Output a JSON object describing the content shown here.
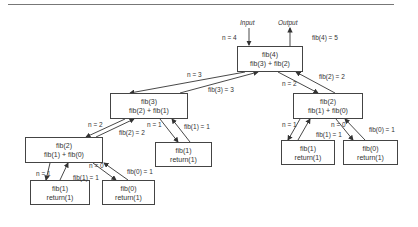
{
  "diagram": {
    "io": {
      "input": "Input",
      "output": "Output"
    },
    "nodes": [
      {
        "id": "fib4",
        "line1": "fib(4)",
        "line2": "fib(3) + fib(2)"
      },
      {
        "id": "fib3",
        "line1": "fib(3)",
        "line2": "fib(2) + fib(1)"
      },
      {
        "id": "fib2_left",
        "line1": "fib(2)",
        "line2": "fib(1) + fib(0)"
      },
      {
        "id": "fib1_ll",
        "line1": "fib(1)",
        "line2": "return(1)"
      },
      {
        "id": "fib0_ll",
        "line1": "fib(0)",
        "line2": "return(1)"
      },
      {
        "id": "fib1_mid",
        "line1": "fib(1)",
        "line2": "return(1)"
      },
      {
        "id": "fib2_right",
        "line1": "fib(2)",
        "line2": "fib(1) + fib(0)"
      },
      {
        "id": "fib1_r",
        "line1": "fib(1)",
        "line2": "return(1)"
      },
      {
        "id": "fib0_r",
        "line1": "fib(0)",
        "line2": "return(1)"
      }
    ],
    "edge_labels": {
      "in_fib4": "n = 4",
      "out_fib4": "fib(4) = 5",
      "call_fib3": "n = 3",
      "ret_fib3": "fib(3) = 3",
      "call_fib2r": "n = 2",
      "ret_fib2r": "fib(2) = 2",
      "call_fib2l": "n = 2",
      "ret_fib2l": "fib(2) = 2",
      "call_fib1mid": "n = 1",
      "ret_fib1mid": "fib(1) = 1",
      "call_fib1ll": "n = 1",
      "ret_fib1ll": "fib(1) = 1",
      "call_fib0ll": "n = 0",
      "ret_fib0ll": "fib(0) = 1",
      "call_fib1r": "n = 1",
      "ret_fib1r": "fib(1) = 1",
      "call_fib0r": "n = 0",
      "ret_fib0r": "fib(0) = 1"
    }
  }
}
